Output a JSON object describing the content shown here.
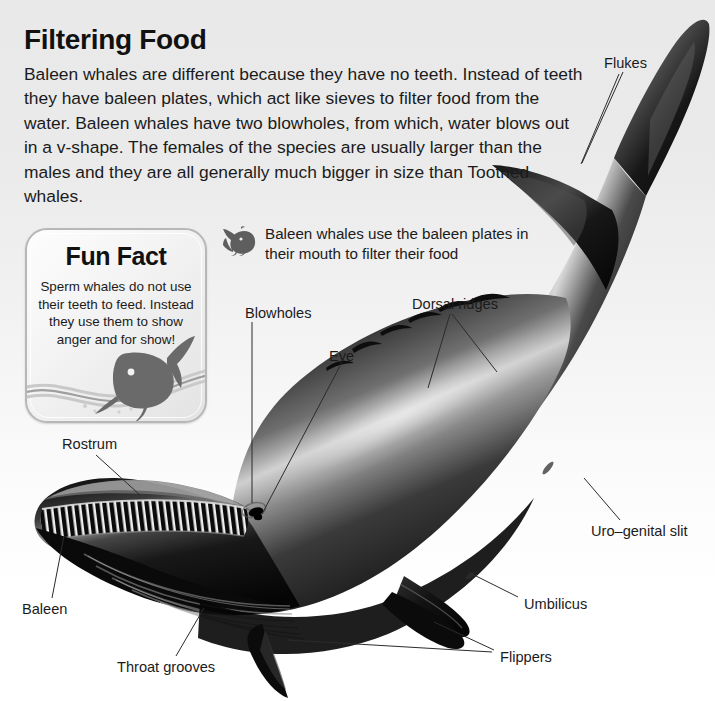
{
  "article": {
    "heading": "Filtering Food",
    "body": "Baleen whales are different because they have no teeth. Instead of teeth they have baleen plates, which act like sieves to filter food from the water. Baleen whales have two blowholes, from which, water blows out in a v-shape. The females of the species are usually larger than the males and they are all generally much bigger in size than Toothed whales."
  },
  "fun_fact": {
    "title": "Fun Fact",
    "text": "Sperm whales do not use their teeth to feed. Instead they use them to show anger and for show!",
    "icon": "sperm-whale-silhouette-icon"
  },
  "caption": {
    "icon": "baleen-whale-icon",
    "text": "Baleen whales use the baleen plates in their mouth to filter their food"
  },
  "diagram": {
    "callouts": [
      {
        "id": "flukes",
        "label": "Flukes",
        "x": 604,
        "y": 62,
        "align": "left"
      },
      {
        "id": "dorsal-ridges",
        "label": "Dorsal ridges",
        "x": 412,
        "y": 303,
        "align": "left"
      },
      {
        "id": "blowholes",
        "label": "Blowholes",
        "x": 245,
        "y": 312,
        "align": "left"
      },
      {
        "id": "eye",
        "label": "Eye",
        "x": 330,
        "y": 355,
        "align": "left"
      },
      {
        "id": "rostrum",
        "label": "Rostrum",
        "x": 62,
        "y": 443,
        "align": "left"
      },
      {
        "id": "uro-genital-slit",
        "label": "Uro–genital slit",
        "x": 591,
        "y": 530,
        "align": "left"
      },
      {
        "id": "umbilicus",
        "label": "Umbilicus",
        "x": 524,
        "y": 603,
        "align": "left"
      },
      {
        "id": "baleen",
        "label": "Baleen",
        "x": 22,
        "y": 608,
        "align": "left"
      },
      {
        "id": "flippers",
        "label": "Flippers",
        "x": 500,
        "y": 656,
        "align": "left"
      },
      {
        "id": "throat-grooves",
        "label": "Throat grooves",
        "x": 117,
        "y": 666,
        "align": "left"
      }
    ]
  },
  "colors": {
    "background_top": "#e9e9e9",
    "background_bottom": "#ffffff",
    "text": "#1b1b1b",
    "leader_line": "#2b2b2b",
    "card_border": "#b7b7b7",
    "whale_dark": "#0d0d0d",
    "whale_highlight": "#f2f2f2"
  }
}
